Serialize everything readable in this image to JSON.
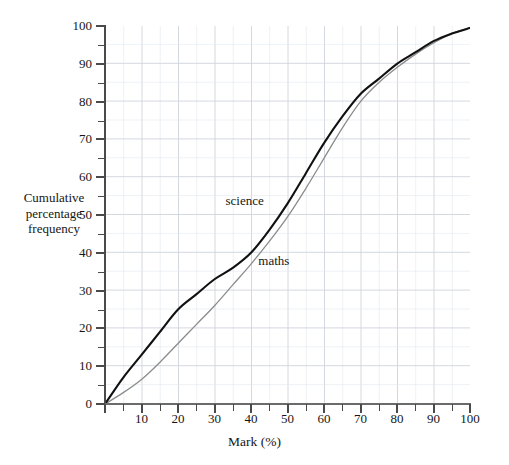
{
  "chart_data": {
    "type": "line",
    "title": "",
    "subtitle": "",
    "xlabel": "Mark (%)",
    "ylabel": "Cumulative percentage frequency",
    "ylabel_lines": [
      "Cumulative",
      "percentage",
      "frequency"
    ],
    "xlim": [
      0,
      100
    ],
    "ylim": [
      0,
      100
    ],
    "xticks": [
      0,
      10,
      20,
      30,
      40,
      50,
      60,
      70,
      80,
      90,
      100
    ],
    "xtick_labels": [
      "",
      "10",
      "20",
      "30",
      "40",
      "50",
      "60",
      "70",
      "80",
      "90",
      "100"
    ],
    "yticks": [
      0,
      10,
      20,
      30,
      40,
      50,
      60,
      70,
      80,
      90,
      100
    ],
    "ytick_labels": [
      "0",
      "10",
      "20",
      "30",
      "40",
      "50",
      "60",
      "70",
      "80",
      "90",
      "100"
    ],
    "grid": true,
    "grid_major_step": 10,
    "grid_minor_step": 5,
    "grid_color": "#cfd4dd",
    "grid_minor_color": "#e3e7ee",
    "legend": "inline-annotations",
    "legend_position": "inline",
    "x": [
      0,
      5,
      10,
      15,
      20,
      25,
      30,
      35,
      40,
      45,
      50,
      55,
      60,
      65,
      70,
      75,
      80,
      85,
      90,
      95,
      100
    ],
    "series": [
      {
        "name": "science",
        "color": "#111111",
        "line_width": 2.1,
        "values": [
          0,
          7,
          13,
          19,
          25,
          29,
          33,
          36,
          40,
          46,
          53,
          61,
          69,
          76,
          82,
          86,
          90,
          93,
          96,
          98,
          99.5
        ],
        "label_x": 33,
        "label_y": 54
      },
      {
        "name": "maths",
        "color": "#8c8c8c",
        "line_width": 1.3,
        "values": [
          0,
          3,
          6.5,
          11,
          16,
          21,
          26,
          31.5,
          37,
          43,
          49.5,
          57,
          65,
          73,
          80,
          85,
          89,
          92.5,
          95.5,
          98,
          99.5
        ],
        "label_x": 42,
        "label_y": 38
      }
    ],
    "annotations": [
      {
        "text": "science",
        "x": 33,
        "y": 54
      },
      {
        "text": "maths",
        "x": 42,
        "y": 38
      }
    ]
  }
}
